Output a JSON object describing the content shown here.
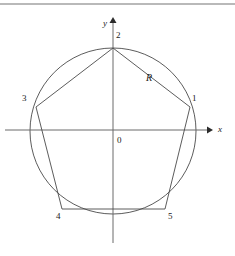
{
  "figure": {
    "background_color": "#ffffff",
    "stroke_color": "#4a4a4a",
    "text_color": "#1a1a1a",
    "rule_color": "#b9b9b9"
  },
  "axes": {
    "x_axis_label": "x",
    "y_axis_label": "y",
    "origin_label": "0",
    "x_axis": {
      "x1": 5,
      "y1": 130,
      "x2": 207,
      "y2": 130
    },
    "y_axis": {
      "x1": 113,
      "y1": 243,
      "x2": 113,
      "y2": 22
    },
    "x_arrow_tip": {
      "x": 212,
      "y": 130
    },
    "y_arrow_tip": {
      "x": 113,
      "y": 17
    }
  },
  "circle": {
    "center": {
      "x": 113,
      "y": 131
    },
    "radius": 83,
    "name": "circumscribed-circle"
  },
  "pentagon": {
    "name": "inscribed-pentagon",
    "radius_label": "R",
    "vertices": [
      {
        "label": "1",
        "x": 190,
        "y": 107,
        "label_x": 192,
        "label_y": 94
      },
      {
        "label": "2",
        "x": 113,
        "y": 48,
        "label_x": 116,
        "label_y": 31
      },
      {
        "label": "3",
        "x": 36,
        "y": 107,
        "label_x": 22,
        "label_y": 94
      },
      {
        "label": "4",
        "x": 62,
        "y": 209,
        "label_x": 56,
        "label_y": 212
      },
      {
        "label": "5",
        "x": 165,
        "y": 209,
        "label_x": 168,
        "label_y": 212
      }
    ],
    "edges": [
      [
        1,
        2
      ],
      [
        2,
        3
      ],
      [
        3,
        4
      ],
      [
        4,
        5
      ],
      [
        5,
        1
      ]
    ]
  },
  "labels": {
    "origin": {
      "text": "0",
      "x": 117,
      "y": 136
    },
    "radius": {
      "text": "R",
      "x": 146,
      "y": 73
    },
    "x_axis": {
      "text": "x",
      "x": 218,
      "y": 125
    },
    "y_axis": {
      "text": "y",
      "x": 103,
      "y": 19
    }
  }
}
